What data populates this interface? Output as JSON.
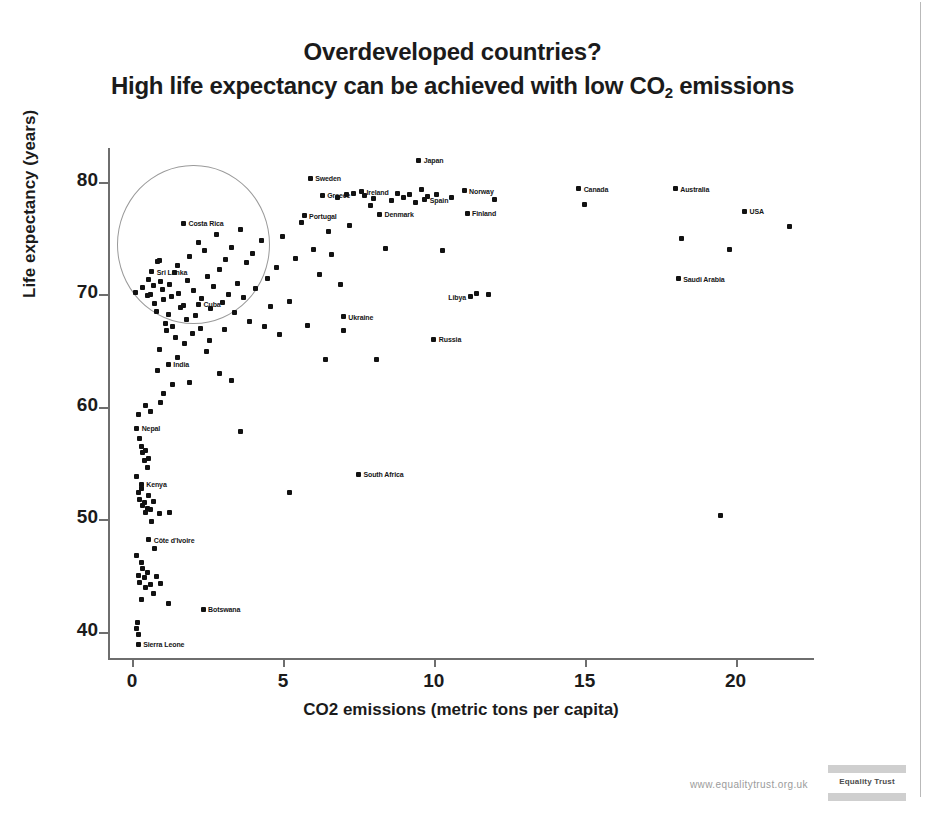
{
  "slide": {
    "title_line1": "Overdeveloped countries?",
    "title_line2_pre": "High life expectancy can be achieved with low CO",
    "title_line2_sub": "2",
    "title_line2_post": " emissions"
  },
  "footer": {
    "url": "www.equalitytrust.org.uk",
    "logo_text": "Equality Trust"
  },
  "chart_data": {
    "type": "scatter",
    "title": "Overdeveloped countries? High life expectancy can be achieved with low CO2 emissions",
    "xlabel": "CO2 emissions (metric tons per capita)",
    "ylabel": "Life expectancy (years)",
    "xlim": [
      -0.8,
      22.6
    ],
    "ylim": [
      37.5,
      83.0
    ],
    "xticks": [
      0,
      5,
      10,
      15,
      20
    ],
    "yticks": [
      40,
      50,
      60,
      70,
      80
    ],
    "grid": false,
    "legend": false,
    "annotation": {
      "shape": "ellipse",
      "note": "Highlighted cluster of low-CO2, high-life-expectancy countries",
      "center_x": 2.0,
      "center_y": 74.5,
      "radius_x": 2.5,
      "radius_y": 7.0
    },
    "labeled_points": [
      {
        "label": "Costa Rica",
        "x": 1.7,
        "y": 76.3,
        "label_side": "right"
      },
      {
        "label": "Sri Lanka",
        "x": 0.65,
        "y": 72.0,
        "label_side": "right"
      },
      {
        "label": "Cuba",
        "x": 2.2,
        "y": 69.1,
        "label_side": "right"
      },
      {
        "label": "Sweden",
        "x": 5.9,
        "y": 80.3,
        "label_side": "right"
      },
      {
        "label": "Greece",
        "x": 6.3,
        "y": 78.8,
        "label_side": "right"
      },
      {
        "label": "Portugal",
        "x": 5.7,
        "y": 77.0,
        "label_side": "right"
      },
      {
        "label": "Ireland",
        "x": 7.6,
        "y": 79.1,
        "label_side": "right"
      },
      {
        "label": "Denmark",
        "x": 8.2,
        "y": 77.1,
        "label_side": "right"
      },
      {
        "label": "Japan",
        "x": 9.5,
        "y": 81.9,
        "label_side": "right"
      },
      {
        "label": "Spain",
        "x": 9.7,
        "y": 78.4,
        "label_side": "right"
      },
      {
        "label": "Norway",
        "x": 11.0,
        "y": 79.2,
        "label_side": "right"
      },
      {
        "label": "Finland",
        "x": 11.1,
        "y": 77.2,
        "label_side": "right"
      },
      {
        "label": "Canada",
        "x": 14.8,
        "y": 79.4,
        "label_side": "right"
      },
      {
        "label": "Australia",
        "x": 18.0,
        "y": 79.4,
        "label_side": "right"
      },
      {
        "label": "USA",
        "x": 20.3,
        "y": 77.4,
        "label_side": "right"
      },
      {
        "label": "Saudi Arabia",
        "x": 18.1,
        "y": 71.4,
        "label_side": "right"
      },
      {
        "label": "Libya",
        "x": 11.2,
        "y": 69.8,
        "label_side": "left"
      },
      {
        "label": "Ukraine",
        "x": 7.0,
        "y": 68.0,
        "label_side": "right"
      },
      {
        "label": "Russia",
        "x": 10.0,
        "y": 66.0,
        "label_side": "right"
      },
      {
        "label": "South Africa",
        "x": 7.5,
        "y": 54.0,
        "label_side": "right"
      },
      {
        "label": "India",
        "x": 1.2,
        "y": 63.8,
        "label_side": "right"
      },
      {
        "label": "Nepal",
        "x": 0.15,
        "y": 58.1,
        "label_side": "right"
      },
      {
        "label": "Kenya",
        "x": 0.3,
        "y": 53.1,
        "label_side": "right"
      },
      {
        "label": "Côte d'Ivoire",
        "x": 0.55,
        "y": 48.2,
        "label_side": "right"
      },
      {
        "label": "Botswana",
        "x": 2.35,
        "y": 42.0,
        "label_side": "right"
      },
      {
        "label": "Sierra Leone",
        "x": 0.2,
        "y": 38.9,
        "label_side": "right"
      }
    ],
    "unlabeled_points": [
      [
        0.1,
        70.2
      ],
      [
        0.35,
        70.6
      ],
      [
        0.5,
        69.9
      ],
      [
        0.55,
        71.3
      ],
      [
        0.6,
        70.0
      ],
      [
        0.7,
        70.8
      ],
      [
        0.75,
        69.2
      ],
      [
        0.8,
        68.5
      ],
      [
        0.85,
        72.9
      ],
      [
        0.9,
        73.0
      ],
      [
        0.95,
        71.1
      ],
      [
        1.0,
        70.4
      ],
      [
        1.05,
        69.5
      ],
      [
        1.1,
        67.4
      ],
      [
        1.15,
        66.8
      ],
      [
        1.2,
        68.2
      ],
      [
        1.25,
        70.9
      ],
      [
        1.3,
        69.8
      ],
      [
        1.35,
        67.1
      ],
      [
        1.4,
        71.9
      ],
      [
        1.45,
        66.2
      ],
      [
        1.5,
        72.6
      ],
      [
        1.55,
        70.1
      ],
      [
        1.6,
        68.8
      ],
      [
        1.7,
        69.0
      ],
      [
        1.75,
        65.6
      ],
      [
        1.8,
        67.8
      ],
      [
        1.85,
        71.2
      ],
      [
        1.9,
        73.4
      ],
      [
        2.0,
        66.5
      ],
      [
        2.05,
        70.3
      ],
      [
        2.1,
        68.1
      ],
      [
        2.2,
        74.6
      ],
      [
        2.25,
        67.0
      ],
      [
        2.3,
        69.6
      ],
      [
        2.4,
        73.9
      ],
      [
        2.5,
        71.6
      ],
      [
        2.55,
        65.9
      ],
      [
        2.6,
        68.7
      ],
      [
        2.7,
        70.7
      ],
      [
        2.8,
        75.3
      ],
      [
        2.9,
        72.2
      ],
      [
        3.0,
        69.3
      ],
      [
        3.05,
        66.9
      ],
      [
        3.1,
        73.1
      ],
      [
        3.2,
        70.0
      ],
      [
        3.3,
        74.2
      ],
      [
        3.4,
        68.4
      ],
      [
        3.5,
        71.0
      ],
      [
        3.6,
        75.8
      ],
      [
        3.7,
        69.7
      ],
      [
        3.8,
        72.8
      ],
      [
        3.9,
        67.6
      ],
      [
        4.0,
        73.6
      ],
      [
        4.1,
        70.5
      ],
      [
        4.3,
        74.8
      ],
      [
        4.5,
        71.4
      ],
      [
        4.6,
        68.9
      ],
      [
        4.8,
        72.4
      ],
      [
        5.0,
        75.1
      ],
      [
        5.2,
        69.4
      ],
      [
        5.4,
        73.2
      ],
      [
        5.6,
        76.4
      ],
      [
        6.0,
        74.0
      ],
      [
        6.2,
        71.8
      ],
      [
        6.5,
        75.6
      ],
      [
        6.6,
        73.5
      ],
      [
        6.8,
        78.6
      ],
      [
        6.9,
        70.9
      ],
      [
        7.1,
        78.9
      ],
      [
        7.2,
        76.1
      ],
      [
        7.35,
        79.0
      ],
      [
        7.7,
        78.8
      ],
      [
        7.9,
        77.9
      ],
      [
        8.0,
        78.5
      ],
      [
        8.1,
        64.2
      ],
      [
        8.4,
        74.1
      ],
      [
        8.6,
        78.3
      ],
      [
        8.8,
        79.0
      ],
      [
        9.0,
        78.6
      ],
      [
        9.2,
        78.9
      ],
      [
        9.4,
        78.2
      ],
      [
        9.6,
        79.3
      ],
      [
        9.8,
        78.7
      ],
      [
        10.1,
        78.9
      ],
      [
        10.3,
        73.9
      ],
      [
        10.6,
        78.6
      ],
      [
        11.4,
        70.1
      ],
      [
        11.8,
        70.0
      ],
      [
        12.0,
        78.4
      ],
      [
        15.0,
        78.0
      ],
      [
        18.2,
        75.0
      ],
      [
        19.5,
        50.3
      ],
      [
        19.8,
        74.0
      ],
      [
        21.8,
        76.0
      ],
      [
        1.9,
        62.2
      ],
      [
        3.3,
        62.3
      ],
      [
        1.05,
        61.2
      ],
      [
        0.95,
        60.4
      ],
      [
        0.45,
        60.1
      ],
      [
        0.6,
        59.6
      ],
      [
        0.2,
        59.3
      ],
      [
        0.25,
        57.2
      ],
      [
        0.3,
        56.5
      ],
      [
        0.35,
        55.9
      ],
      [
        0.4,
        55.2
      ],
      [
        0.45,
        56.1
      ],
      [
        0.5,
        54.6
      ],
      [
        0.55,
        55.4
      ],
      [
        0.15,
        53.8
      ],
      [
        0.2,
        52.4
      ],
      [
        0.25,
        51.8
      ],
      [
        0.3,
        52.7
      ],
      [
        0.35,
        51.2
      ],
      [
        0.4,
        51.5
      ],
      [
        0.45,
        50.6
      ],
      [
        0.5,
        51.0
      ],
      [
        0.55,
        52.1
      ],
      [
        0.6,
        50.9
      ],
      [
        0.65,
        49.8
      ],
      [
        0.7,
        51.6
      ],
      [
        0.9,
        50.5
      ],
      [
        1.25,
        50.6
      ],
      [
        5.2,
        52.4
      ],
      [
        0.75,
        47.4
      ],
      [
        0.15,
        46.8
      ],
      [
        0.3,
        46.2
      ],
      [
        0.35,
        45.6
      ],
      [
        0.2,
        45.0
      ],
      [
        0.25,
        44.4
      ],
      [
        0.4,
        44.8
      ],
      [
        0.45,
        43.9
      ],
      [
        0.5,
        45.3
      ],
      [
        0.6,
        44.2
      ],
      [
        0.8,
        44.9
      ],
      [
        0.95,
        44.3
      ],
      [
        0.7,
        43.4
      ],
      [
        0.3,
        42.9
      ],
      [
        1.2,
        42.5
      ],
      [
        0.15,
        40.3
      ],
      [
        0.2,
        39.8
      ],
      [
        0.18,
        40.8
      ],
      [
        2.9,
        63.0
      ],
      [
        3.6,
        57.8
      ],
      [
        1.5,
        64.4
      ],
      [
        0.9,
        65.1
      ],
      [
        0.85,
        63.2
      ],
      [
        1.35,
        62.0
      ],
      [
        6.4,
        64.2
      ],
      [
        7.0,
        66.8
      ],
      [
        5.8,
        67.2
      ],
      [
        4.4,
        67.1
      ],
      [
        4.9,
        66.4
      ],
      [
        2.45,
        64.9
      ]
    ]
  }
}
